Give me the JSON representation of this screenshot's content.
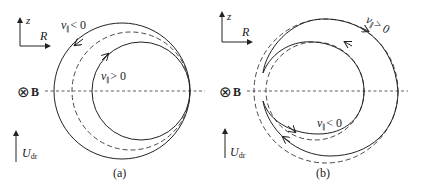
{
  "panels": [
    {
      "id": "a",
      "caption": "(a)",
      "axes": {
        "z": "z",
        "R": "R"
      },
      "field_label": "B",
      "drift_label": "U",
      "drift_sub": "dr",
      "labels": {
        "outer_v": "v",
        "outer_sub": "∥",
        "outer_rel": "< 0",
        "inner_v": "v",
        "inner_sub": "∥",
        "inner_rel": "> 0"
      }
    },
    {
      "id": "b",
      "caption": "(b)",
      "axes": {
        "z": "z",
        "R": "R"
      },
      "field_label": "B",
      "drift_label": "U",
      "drift_sub": "dr",
      "labels": {
        "outer_v": "v",
        "outer_sub": "∥",
        "outer_rel": "> 0",
        "inner_v": "v",
        "inner_sub": "∥",
        "inner_rel": "< 0"
      }
    }
  ],
  "icons": {
    "field_into_page": "⊗"
  }
}
